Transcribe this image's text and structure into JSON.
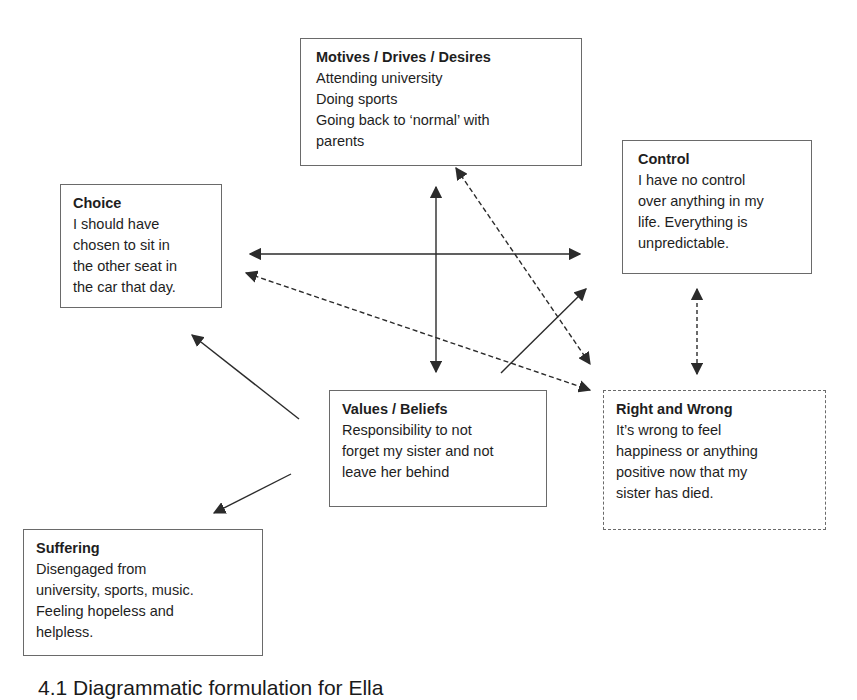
{
  "diagram": {
    "boxes": {
      "motives": {
        "title": "Motives / Drives / Desires",
        "lines": [
          "Attending university",
          "Doing sports",
          "Going back to ‘normal’ with",
          "parents"
        ]
      },
      "control": {
        "title": "Control",
        "lines": [
          "I have no control",
          "over anything in my",
          "life. Everything is",
          "unpredictable."
        ]
      },
      "choice": {
        "title": "Choice",
        "lines": [
          "I should have",
          "chosen to sit in",
          "the other seat in",
          "the car that day."
        ]
      },
      "values": {
        "title": "Values / Beliefs",
        "lines": [
          "Responsibility to not",
          "forget my sister and not",
          "leave her behind"
        ]
      },
      "right_wrong": {
        "title": "Right and Wrong",
        "lines": [
          "It’s wrong to feel",
          "happiness or anything",
          "positive now that my",
          "sister has died."
        ]
      },
      "suffering": {
        "title": "Suffering",
        "lines": [
          "Disengaged from",
          "university, sports, music.",
          "Feeling hopeless and",
          "helpless."
        ]
      }
    },
    "arrows": [
      {
        "from": "choice",
        "to": "control",
        "style": "solid",
        "heads": "both"
      },
      {
        "from": "motives",
        "to": "values",
        "style": "solid",
        "heads": "both"
      },
      {
        "from": "motives",
        "to": "right_wrong",
        "style": "dashed",
        "heads": "both"
      },
      {
        "from": "choice",
        "to": "right_wrong",
        "style": "dashed",
        "heads": "both"
      },
      {
        "from": "values",
        "to": "control",
        "style": "solid",
        "heads": "end"
      },
      {
        "from": "control",
        "to": "right_wrong",
        "style": "dashed",
        "heads": "both"
      },
      {
        "from": "values",
        "to": "choice",
        "style": "solid",
        "heads": "end"
      },
      {
        "from": "values",
        "to": "suffering",
        "style": "solid",
        "heads": "end"
      }
    ],
    "caption": "4.1  Diagrammatic formulation for Ella"
  },
  "colors": {
    "line": "#2b2b2b",
    "border": "#6a6a6a",
    "text": "#1e1e1e"
  }
}
